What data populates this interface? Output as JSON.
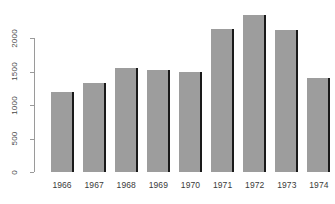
{
  "chart_data": {
    "type": "bar",
    "title": "",
    "subtitle": "",
    "xlabel": "",
    "ylabel": "",
    "categories": [
      "1966",
      "1967",
      "1968",
      "1969",
      "1970",
      "1971",
      "1972",
      "1973",
      "1974"
    ],
    "values": [
      1200,
      1330,
      1550,
      1520,
      1490,
      2130,
      2350,
      2120,
      1400
    ],
    "ylim": [
      0,
      2000
    ],
    "yticks": [
      0,
      500,
      1000,
      1500,
      2000
    ],
    "ytick_labels": [
      "0",
      "500",
      "1000",
      "1500",
      "2000"
    ],
    "grid": false,
    "legend": null,
    "bar_color": "#9d9d9d",
    "bar_edge_color": "#1a1a1a",
    "axis_color": "#9a9a9a",
    "background_color": "#ffffff",
    "text_color": "#3a3a3a",
    "annotations": []
  },
  "axis": {
    "y_tick_labels": [
      "0",
      "500",
      "1000",
      "1500",
      "2000"
    ]
  }
}
